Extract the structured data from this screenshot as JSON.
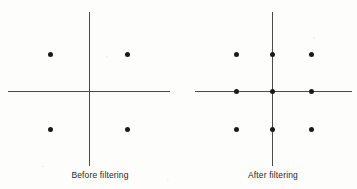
{
  "figure": {
    "background_color": "#fdfdfc",
    "axis_color": "#4a4a4a",
    "dot_color": "#1a1a1a",
    "caption_color": "#26262a"
  },
  "panels": [
    {
      "id": "before",
      "caption": "Before filtering",
      "caption_x": 100,
      "origin": {
        "x": 89,
        "y": 91
      },
      "axis_h": {
        "x1": 8,
        "x2": 170,
        "y": 91
      },
      "axis_v": {
        "y1": 12,
        "y2": 166,
        "x": 89
      },
      "dots": [
        {
          "x": 50,
          "y": 54
        },
        {
          "x": 127,
          "y": 54
        },
        {
          "x": 50,
          "y": 129
        },
        {
          "x": 127,
          "y": 129
        }
      ]
    },
    {
      "id": "after",
      "caption": "After filtering",
      "caption_x": 273,
      "origin": {
        "x": 272,
        "y": 91
      },
      "axis_h": {
        "x1": 195,
        "x2": 352,
        "y": 91
      },
      "axis_v": {
        "y1": 12,
        "y2": 166,
        "x": 272
      },
      "dots": [
        {
          "x": 236,
          "y": 54
        },
        {
          "x": 272,
          "y": 54
        },
        {
          "x": 311,
          "y": 54
        },
        {
          "x": 236,
          "y": 91
        },
        {
          "x": 272,
          "y": 91
        },
        {
          "x": 311,
          "y": 91
        },
        {
          "x": 236,
          "y": 129
        },
        {
          "x": 272,
          "y": 129
        },
        {
          "x": 311,
          "y": 129
        }
      ]
    }
  ],
  "chart_data": {
    "type": "scatter",
    "title": "",
    "xlabel": "",
    "ylabel": "",
    "grid": false,
    "legend": "none",
    "xlim": [
      -2,
      2
    ],
    "ylim": [
      -2,
      2
    ],
    "series": [
      {
        "name": "Before filtering",
        "points": [
          {
            "x": -1,
            "y": 1
          },
          {
            "x": 1,
            "y": 1
          },
          {
            "x": -1,
            "y": -1
          },
          {
            "x": 1,
            "y": -1
          }
        ],
        "count": 4
      },
      {
        "name": "After filtering",
        "points": [
          {
            "x": -1,
            "y": 1
          },
          {
            "x": 0,
            "y": 1
          },
          {
            "x": 1,
            "y": 1
          },
          {
            "x": -1,
            "y": 0
          },
          {
            "x": 0,
            "y": 0
          },
          {
            "x": 1,
            "y": 0
          },
          {
            "x": -1,
            "y": -1
          },
          {
            "x": 0,
            "y": -1
          },
          {
            "x": 1,
            "y": -1
          }
        ],
        "count": 9
      }
    ]
  }
}
